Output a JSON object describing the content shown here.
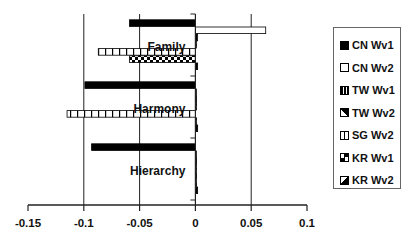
{
  "chart_data": {
    "type": "bar",
    "orientation": "horizontal",
    "title": "",
    "xlabel": "",
    "ylabel": "",
    "xlim": [
      -0.15,
      0.1
    ],
    "x_ticks": [
      "-0.15",
      "-0.1",
      "-0.05",
      "0",
      "0.05",
      "0.1"
    ],
    "grid": "vertical",
    "legend_position": "right",
    "categories": [
      "Family",
      "Harmony",
      "Hierarchy"
    ],
    "series": [
      {
        "name": "CN Wv1",
        "pattern": "solid-black",
        "values": [
          -0.059,
          -0.099,
          -0.093
        ]
      },
      {
        "name": "CN Wv2",
        "pattern": "white",
        "values": [
          0.063,
          0.001,
          0.001
        ]
      },
      {
        "name": "TW Wv1",
        "pattern": "vertical-stripes",
        "values": [
          0.002,
          0.001,
          0.001
        ]
      },
      {
        "name": "TW Wv2",
        "pattern": "diagonal",
        "values": [
          0.001,
          0.001,
          0.001
        ]
      },
      {
        "name": "SG Wv2",
        "pattern": "grid-squares",
        "values": [
          -0.087,
          -0.115,
          0.001
        ]
      },
      {
        "name": "KR Wv1",
        "pattern": "checkerboard",
        "values": [
          -0.059,
          0.001,
          0.001
        ]
      },
      {
        "name": "KR Wv2",
        "pattern": "corner-block",
        "values": [
          0.002,
          0.002,
          0.002
        ]
      }
    ]
  },
  "legend": {
    "items": [
      {
        "label": "CN Wv1"
      },
      {
        "label": "CN Wv2"
      },
      {
        "label": "TW Wv1"
      },
      {
        "label": "TW Wv2"
      },
      {
        "label": "SG Wv2"
      },
      {
        "label": "KR Wv1"
      },
      {
        "label": "KR Wv2"
      }
    ]
  }
}
